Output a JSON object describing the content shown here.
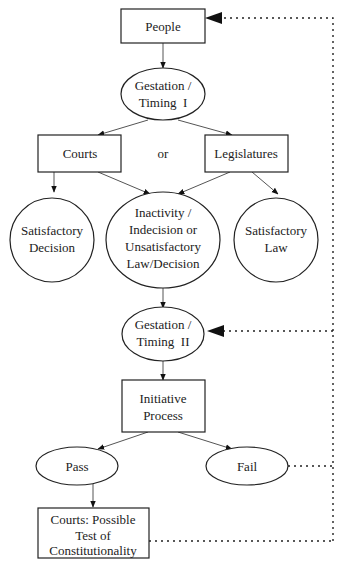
{
  "diagram": {
    "nodes": {
      "people": {
        "lines": [
          "People"
        ],
        "shape": "rect"
      },
      "gestation1": {
        "lines": [
          "Gestation /",
          "Timing  I"
        ],
        "shape": "ellipse"
      },
      "courts": {
        "lines": [
          "Courts"
        ],
        "shape": "rect"
      },
      "or": {
        "lines": [
          "or"
        ],
        "shape": "text"
      },
      "legislatures": {
        "lines": [
          "Legislatures"
        ],
        "shape": "rect"
      },
      "sat_decision": {
        "lines": [
          "Satisfactory",
          "Decision"
        ],
        "shape": "circle"
      },
      "inactivity": {
        "lines": [
          "Inactivity /",
          "Indecision or",
          "Unsatisfactory",
          "Law/Decision"
        ],
        "shape": "ellipse"
      },
      "sat_law": {
        "lines": [
          "Satisfactory",
          "Law"
        ],
        "shape": "circle"
      },
      "gestation2": {
        "lines": [
          "Gestation /",
          "Timing  II"
        ],
        "shape": "ellipse"
      },
      "initiative": {
        "lines": [
          "Initiative",
          "Process"
        ],
        "shape": "rect"
      },
      "pass": {
        "lines": [
          "Pass"
        ],
        "shape": "ellipse"
      },
      "fail": {
        "lines": [
          "Fail"
        ],
        "shape": "ellipse"
      },
      "courts_test": {
        "lines": [
          "Courts: Possible",
          "Test of",
          "Constitutionality"
        ],
        "shape": "rect"
      }
    },
    "edges": [
      {
        "from": "people",
        "to": "gestation1",
        "style": "solid"
      },
      {
        "from": "gestation1",
        "to": "courts",
        "style": "solid"
      },
      {
        "from": "gestation1",
        "to": "legislatures",
        "style": "solid"
      },
      {
        "from": "courts",
        "to": "sat_decision",
        "style": "solid"
      },
      {
        "from": "courts",
        "to": "inactivity",
        "style": "solid"
      },
      {
        "from": "legislatures",
        "to": "inactivity",
        "style": "solid"
      },
      {
        "from": "legislatures",
        "to": "sat_law",
        "style": "solid"
      },
      {
        "from": "inactivity",
        "to": "gestation2",
        "style": "solid"
      },
      {
        "from": "gestation2",
        "to": "initiative",
        "style": "solid"
      },
      {
        "from": "initiative",
        "to": "pass",
        "style": "solid"
      },
      {
        "from": "initiative",
        "to": "fail",
        "style": "solid"
      },
      {
        "from": "pass",
        "to": "courts_test",
        "style": "solid"
      },
      {
        "from": "fail",
        "to": "gestation2",
        "style": "dotted"
      },
      {
        "from": "courts_test",
        "to": "gestation2",
        "style": "dotted"
      },
      {
        "from": "gestation2",
        "to": "people",
        "style": "dotted"
      }
    ]
  }
}
